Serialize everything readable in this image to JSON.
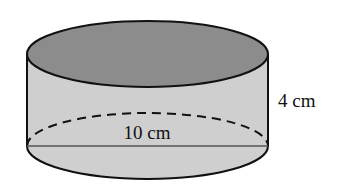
{
  "figure": {
    "shape": "cylinder",
    "colors": {
      "top_face": "#8c8c8c",
      "side": "#cfcfcf",
      "outline": "#111111",
      "diameter_line": "#555555",
      "background": "#ffffff"
    },
    "labels": {
      "height": "4 cm",
      "diameter": "10 cm"
    }
  }
}
